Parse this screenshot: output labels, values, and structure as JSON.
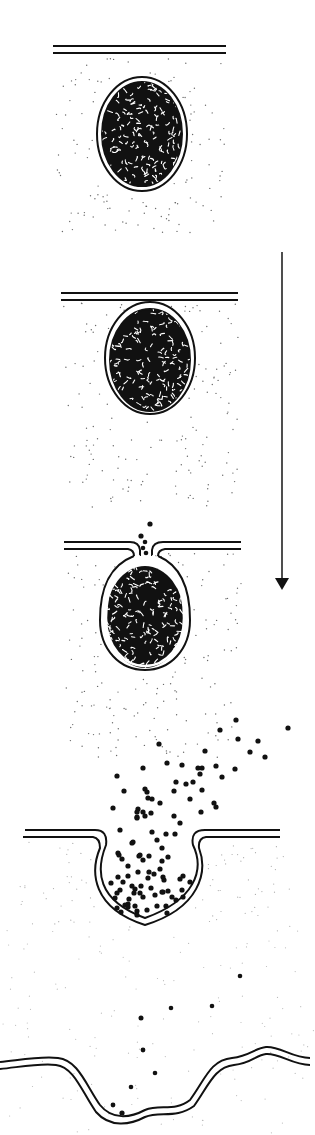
{
  "title": "Exocytosis of a secretory vesicle",
  "colors": {
    "ink": "#111111",
    "cytoplasm_dot": "#6a6a6a",
    "background": "#ffffff"
  },
  "arrow": {
    "label": "time / sequence direction",
    "x": 282,
    "y1": 252,
    "y2": 590
  },
  "stages": [
    {
      "id": 1,
      "name": "Vesicle in cytoplasm, separate from plasma membrane",
      "membrane_y": 47,
      "membrane_x": [
        53,
        226
      ],
      "vesicle": {
        "cx": 142,
        "cy": 134,
        "rx": 45,
        "ry": 57
      },
      "cytoplasm_box": {
        "x": 55,
        "y": 58,
        "w": 170,
        "h": 175
      }
    },
    {
      "id": 2,
      "name": "Vesicle docks against plasma membrane",
      "membrane_y": 296,
      "membrane_x": [
        61,
        238
      ],
      "vesicle": {
        "cx": 150,
        "cy": 360,
        "rx": 45,
        "ry": 56
      },
      "cytoplasm_box": {
        "x": 63,
        "y": 303,
        "w": 175,
        "h": 205
      }
    },
    {
      "id": 3,
      "name": "Fusion pore opens, contents begin to escape",
      "membrane_y": 547,
      "membrane_x": [
        64,
        241
      ],
      "vesicle": {
        "cx": 145,
        "cy": 615,
        "rx": 45,
        "ry": 56
      },
      "cytoplasm_box": {
        "x": 66,
        "y": 553,
        "w": 175,
        "h": 205
      }
    },
    {
      "id": 4,
      "name": "Vesicle opens into membrane pocket, contents released",
      "membrane_y": 836,
      "membrane_x": [
        23,
        280
      ]
    },
    {
      "id": 5,
      "name": "Vesicle membrane incorporated into plasma membrane",
      "membrane_y": 1065
    }
  ]
}
